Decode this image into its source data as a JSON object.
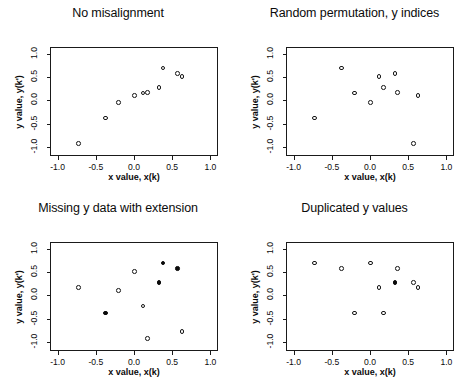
{
  "figure": {
    "width": 473,
    "height": 390,
    "background": "#ffffff",
    "ink_color": "#111111",
    "layout": "2x2 grid of scatter panels"
  },
  "axis": {
    "xlabel": "x value, x(k)",
    "ylabel": "y value, y(k')",
    "xticks": [
      "-1.0",
      "-0.5",
      "0.0",
      "0.5",
      "1.0"
    ],
    "yticks": [
      "-1.0",
      "-0.5",
      "0.0",
      "0.5",
      "1.0"
    ],
    "xtick_values": [
      -1.0,
      -0.5,
      0.0,
      0.5,
      1.0
    ],
    "ytick_values": [
      -1.0,
      -0.5,
      0.0,
      0.5,
      1.0
    ],
    "xlim": [
      -1.1,
      1.1
    ],
    "ylim": [
      -1.2,
      1.15
    ],
    "grid": false
  },
  "markers": {
    "open_label": "open circle",
    "filled_label": "filled circle",
    "open_color": "#ffffff",
    "edge_color": "#141414",
    "filled_color": "#0a0a0a"
  },
  "chart_data": [
    {
      "type": "scatter",
      "title": "No misalignment",
      "xlabel": "x value, x(k)",
      "ylabel": "y value, y(k')",
      "xlim": [
        -1.1,
        1.1
      ],
      "ylim": [
        -1.2,
        1.15
      ],
      "grid": false,
      "series": [
        {
          "name": "open points",
          "marker": "open",
          "points": [
            [
              -0.73,
              -0.93
            ],
            [
              -0.37,
              -0.38
            ],
            [
              -0.2,
              -0.05
            ],
            [
              0.01,
              0.1
            ],
            [
              0.12,
              0.16
            ],
            [
              0.18,
              0.17
            ],
            [
              0.33,
              0.28
            ],
            [
              0.38,
              0.7
            ],
            [
              0.57,
              0.58
            ],
            [
              0.63,
              0.52
            ]
          ]
        }
      ]
    },
    {
      "type": "scatter",
      "title": "Random permutation, y indices",
      "xlabel": "x value, x(k)",
      "ylabel": "y value, y(k')",
      "xlim": [
        -1.1,
        1.1
      ],
      "ylim": [
        -1.2,
        1.15
      ],
      "grid": false,
      "series": [
        {
          "name": "open points",
          "marker": "open",
          "points": [
            [
              -0.73,
              -0.38
            ],
            [
              -0.37,
              0.7
            ],
            [
              -0.2,
              0.16
            ],
            [
              0.01,
              -0.05
            ],
            [
              0.12,
              0.52
            ],
            [
              0.18,
              0.28
            ],
            [
              0.33,
              0.58
            ],
            [
              0.36,
              0.17
            ],
            [
              0.57,
              -0.93
            ],
            [
              0.63,
              0.1
            ]
          ]
        }
      ]
    },
    {
      "type": "scatter",
      "title": "Missing y data with extension",
      "xlabel": "x value, x(k)",
      "ylabel": "y value, y(k')",
      "xlim": [
        -1.1,
        1.1
      ],
      "ylim": [
        -1.2,
        1.15
      ],
      "grid": false,
      "series": [
        {
          "name": "open points",
          "marker": "open",
          "points": [
            [
              -0.73,
              0.17
            ],
            [
              -0.2,
              0.1
            ],
            [
              0.01,
              0.52
            ],
            [
              0.12,
              -0.23
            ],
            [
              0.18,
              -0.93
            ],
            [
              0.63,
              -0.78
            ]
          ]
        },
        {
          "name": "filled points",
          "marker": "filled",
          "points": [
            [
              -0.37,
              -0.38
            ],
            [
              0.33,
              0.28
            ],
            [
              0.38,
              0.7
            ],
            [
              0.57,
              0.58
            ]
          ]
        }
      ]
    },
    {
      "type": "scatter",
      "title": "Duplicated y values",
      "xlabel": "x value, x(k)",
      "ylabel": "y value, y(k')",
      "xlim": [
        -1.1,
        1.1
      ],
      "ylim": [
        -1.2,
        1.15
      ],
      "grid": false,
      "series": [
        {
          "name": "open points",
          "marker": "open",
          "points": [
            [
              -0.73,
              0.7
            ],
            [
              -0.37,
              0.58
            ],
            [
              -0.2,
              -0.38
            ],
            [
              0.01,
              0.7
            ],
            [
              0.12,
              0.17
            ],
            [
              0.18,
              -0.38
            ],
            [
              0.36,
              0.58
            ],
            [
              0.57,
              0.28
            ],
            [
              0.63,
              0.17
            ]
          ]
        },
        {
          "name": "filled points",
          "marker": "filled",
          "points": [
            [
              0.33,
              0.28
            ]
          ]
        }
      ]
    }
  ]
}
